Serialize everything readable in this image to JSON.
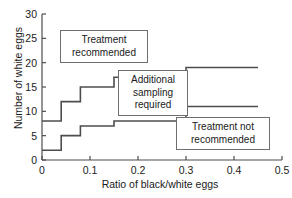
{
  "chart_data": {
    "type": "line",
    "subtype": "step-post",
    "title": "",
    "xlabel": "Ratio of black/white eggs",
    "ylabel": "Number of white eggs",
    "xlim": [
      0,
      0.5
    ],
    "ylim": [
      0,
      30
    ],
    "xticks": [
      "0",
      "0.1",
      "0.2",
      "0.3",
      "0.4",
      "0.5"
    ],
    "xtick_values": [
      0,
      0.1,
      0.2,
      0.3,
      0.4,
      0.5
    ],
    "yticks": [
      "0",
      "5",
      "10",
      "15",
      "20",
      "25",
      "30"
    ],
    "ytick_values": [
      0,
      5,
      10,
      15,
      20,
      25,
      30
    ],
    "grid": false,
    "legend": "none",
    "series": [
      {
        "name": "upper-threshold",
        "color": "#4d4d4d",
        "x": [
          0,
          0.04,
          0.04,
          0.08,
          0.08,
          0.15,
          0.15,
          0.3,
          0.3,
          0.45
        ],
        "y": [
          8,
          8,
          12,
          12,
          15,
          15,
          17,
          17,
          19,
          19
        ]
      },
      {
        "name": "lower-threshold",
        "color": "#4d4d4d",
        "x": [
          0,
          0.04,
          0.04,
          0.08,
          0.08,
          0.15,
          0.15,
          0.3,
          0.3,
          0.45
        ],
        "y": [
          2,
          2,
          5,
          5,
          7,
          7,
          8,
          8,
          11,
          11
        ]
      }
    ],
    "annotations": [
      {
        "name": "treatment-recommended",
        "text": "Treatment\nrecommended",
        "x": 0.06,
        "y": 23
      },
      {
        "name": "additional-sampling-required",
        "text": "Additional\nsampling\nrequired",
        "x": 0.19,
        "y": 14
      },
      {
        "name": "treatment-not-recommended",
        "text": "Treatment not\nrecommended",
        "x": 0.33,
        "y": 5
      }
    ]
  },
  "axis_color": "#4d4d4d"
}
